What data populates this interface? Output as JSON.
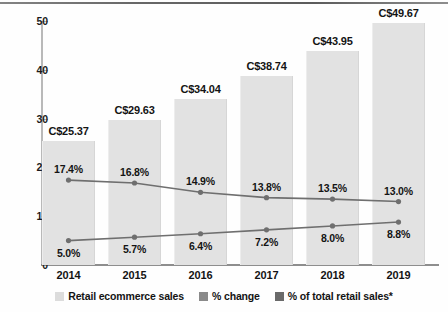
{
  "chart_data": {
    "type": "bar",
    "title": "",
    "subtitle": "",
    "xlabel": "",
    "ylabel": "",
    "categories": [
      "2014",
      "2015",
      "2016",
      "2017",
      "2018",
      "2019"
    ],
    "ylim": [
      0,
      50
    ],
    "y_ticks": [
      0,
      10,
      20,
      30,
      40,
      50
    ],
    "y_tick_labels": [
      "0",
      "10",
      "20",
      "30",
      "40",
      "50"
    ],
    "grid": false,
    "legend_position": "bottom",
    "series": [
      {
        "name": "Retail ecommerce sales",
        "type": "bar",
        "color": "#e2e2e2",
        "values": [
          25.37,
          29.63,
          34.04,
          38.74,
          43.95,
          49.67
        ],
        "labels": [
          "C$25.37",
          "C$29.63",
          "C$34.04",
          "C$38.74",
          "C$43.95",
          "C$49.67"
        ]
      },
      {
        "name": "% change",
        "type": "line",
        "color": "#6f6f6f",
        "values": [
          17.4,
          16.8,
          14.9,
          13.8,
          13.5,
          13.0
        ],
        "labels": [
          "17.4%",
          "16.8%",
          "14.9%",
          "13.8%",
          "13.5%",
          "13.0%"
        ]
      },
      {
        "name": "% of total retail sales*",
        "type": "line",
        "color": "#6f6f6f",
        "values": [
          5.0,
          5.7,
          6.4,
          7.2,
          8.0,
          8.8
        ],
        "labels": [
          "5.0%",
          "5.7%",
          "6.4%",
          "7.2%",
          "8.0%",
          "8.8%"
        ]
      }
    ]
  },
  "axis": {
    "y_labels": [
      "50",
      "40",
      "30",
      "20",
      "10",
      "0"
    ],
    "x_labels": [
      "2014",
      "2015",
      "2016",
      "2017",
      "2018",
      "2019"
    ]
  },
  "bar_labels": [
    "C$25.37",
    "C$29.63",
    "C$34.04",
    "C$38.74",
    "C$43.95",
    "C$49.67"
  ],
  "change_labels": [
    "17.4%",
    "16.8%",
    "14.9%",
    "13.8%",
    "13.5%",
    "13.0%"
  ],
  "share_labels": [
    "5.0%",
    "5.7%",
    "6.4%",
    "7.2%",
    "8.0%",
    "8.8%"
  ],
  "legend": {
    "items": [
      {
        "label": "Retail ecommerce sales",
        "color": "#dcdcdc"
      },
      {
        "label": "% change",
        "color": "#8a8a8a"
      },
      {
        "label": "% of total retail sales*",
        "color": "#6a6a6a"
      }
    ]
  },
  "colors": {
    "bar": "#e2e2e2",
    "line": "#6f6f6f",
    "text": "#141414",
    "axis": "#8e8e8e"
  }
}
